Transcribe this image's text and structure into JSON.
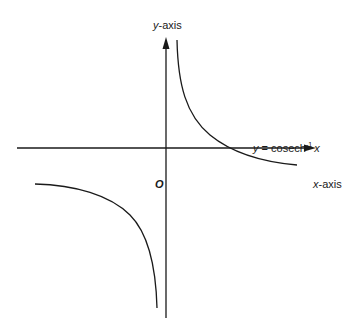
{
  "diagram": {
    "y_axis_label": {
      "var": "y",
      "text": "-axis"
    },
    "x_axis_label": {
      "var": "x",
      "text": "-axis"
    },
    "origin_label": "O",
    "curve_label": {
      "lhs": "y",
      "eq": " = cosech",
      "sup": "-1",
      "arg": "x"
    },
    "colors": {
      "line": "#1a1a1a",
      "background": "#ffffff"
    }
  }
}
